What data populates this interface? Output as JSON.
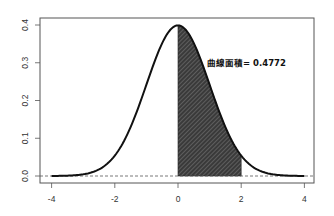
{
  "chart_data": {
    "type": "area",
    "title": "",
    "xlabel": "",
    "ylabel": "",
    "xlim": [
      -4.35,
      4.35
    ],
    "ylim": [
      -0.02,
      0.41
    ],
    "x_ticks": [
      -4,
      -2,
      0,
      2,
      4
    ],
    "x_tick_labels": [
      "-4",
      "-2",
      "0",
      "2",
      "4"
    ],
    "y_ticks": [
      0.0,
      0.1,
      0.2,
      0.3,
      0.4
    ],
    "y_tick_labels": [
      "0.0",
      "0.1",
      "0.2",
      "0.3",
      "0.4"
    ],
    "grid": false,
    "legend": null,
    "series": [
      {
        "name": "N(0,1) density",
        "x": [
          -4,
          -3.5,
          -3,
          -2.5,
          -2,
          -1.5,
          -1,
          -0.5,
          0,
          0.5,
          1,
          1.5,
          2,
          2.5,
          3,
          3.5,
          4
        ],
        "values": [
          0.0001,
          0.0009,
          0.0044,
          0.0175,
          0.054,
          0.1295,
          0.242,
          0.3521,
          0.3989,
          0.3521,
          0.242,
          0.1295,
          0.054,
          0.0175,
          0.0044,
          0.0009,
          0.0001
        ]
      }
    ],
    "shaded_region": {
      "from": 0,
      "to": 2,
      "area": 0.4772,
      "fill": "#444444",
      "pattern": "diagonal-hatch"
    },
    "reference_line": {
      "y": 0,
      "style": "dashed"
    },
    "annotation": {
      "text": "曲線面積= 0.4772",
      "x": 1.0,
      "y": 0.305
    }
  },
  "colors": {
    "curve": "#111111",
    "shade": "#3a3a3a",
    "hatch": "#8a8a8a",
    "frame": "#555555",
    "baseline": "#555555"
  }
}
